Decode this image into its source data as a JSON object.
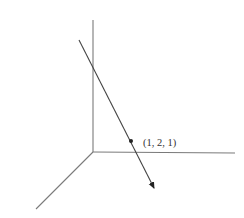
{
  "diagram": {
    "type": "3d-coordinate-axes-with-line",
    "axes": {
      "origin": [
        93,
        152
      ],
      "z_axis_end": [
        93,
        20
      ],
      "y_axis_end": [
        235,
        153
      ],
      "x_axis_end": [
        36,
        209
      ]
    },
    "line": {
      "start": [
        79,
        40
      ],
      "end": [
        154,
        188
      ],
      "arrowhead": "end"
    },
    "point": {
      "position": [
        131,
        141
      ],
      "label": "(1, 2, 1)"
    },
    "colors": {
      "axis": "#7a7a7a",
      "line": "#444444",
      "point": "#222222",
      "background": "#ffffff"
    }
  }
}
